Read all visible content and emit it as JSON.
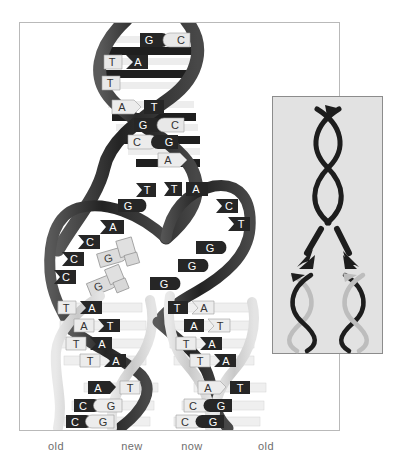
{
  "figure": {
    "background": "#ffffff"
  },
  "colors": {
    "old_strand": "#2b2b2b",
    "old_strand_mid": "#4a4a4a",
    "new_strand": "#d2d2d2",
    "new_strand_edge": "#b0b0b0",
    "base_dark_fill": "#262626",
    "base_light_fill": "#e6e6e6",
    "base_dark_text": "#ffffff",
    "base_light_text": "#3a3a3a",
    "rung_light": "#efefef",
    "rung_dark": "#1f1f1f",
    "frame_border": "#b9b9b9",
    "inset_background": "#e2e2e2",
    "inset_border": "#8c8c8c",
    "label_text": "#6e6e6e",
    "free_nucleotide_fill": "#dcdcdc",
    "free_nucleotide_edge": "#9a9a9a"
  },
  "labels": {
    "old_left": "old",
    "new_left": "new",
    "new_right": "now",
    "old_right": "old"
  },
  "parent_helix": {
    "description": "Unreplicated parent double helix at the top of the figure",
    "base_pairs": [
      {
        "left": "G",
        "right": "C",
        "left_style": "dark",
        "right_style": "light",
        "y": 43
      },
      {
        "left": "T",
        "right": "A",
        "left_style": "light",
        "right_style": "dark",
        "y": 64
      },
      {
        "left": "T",
        "right": "",
        "left_style": "light",
        "right_style": "none",
        "y": 82
      },
      {
        "left": "A",
        "right": "T",
        "left_style": "light",
        "right_style": "dark",
        "y": 107
      },
      {
        "left": "G",
        "right": "C",
        "left_style": "dark",
        "right_style": "light",
        "y": 124
      },
      {
        "left": "C",
        "right": "G",
        "left_style": "light",
        "right_style": "dark",
        "y": 141
      },
      {
        "left": "",
        "right": "A",
        "left_style": "none",
        "right_style": "light",
        "y": 159
      }
    ]
  },
  "replication_fork": {
    "description": "Unwound single strands at the replication fork with unpaired bases",
    "left_template_bases": [
      {
        "base": "T",
        "x": 142,
        "y": 190
      },
      {
        "base": "G",
        "x": 126,
        "y": 205
      },
      {
        "base": "A",
        "x": 112,
        "y": 226
      },
      {
        "base": "C",
        "x": 88,
        "y": 241
      },
      {
        "base": "C",
        "x": 72,
        "y": 258
      },
      {
        "base": "C",
        "x": 64,
        "y": 276
      }
    ],
    "right_template_bases": [
      {
        "base": "T",
        "x": 172,
        "y": 189
      },
      {
        "base": "A",
        "x": 193,
        "y": 189
      },
      {
        "base": "C",
        "x": 226,
        "y": 206
      },
      {
        "base": "T",
        "x": 238,
        "y": 224
      },
      {
        "base": "G",
        "x": 210,
        "y": 247
      },
      {
        "base": "G",
        "x": 192,
        "y": 265
      },
      {
        "base": "G",
        "x": 163,
        "y": 283
      }
    ],
    "free_nucleotides": [
      {
        "base": "G",
        "x": 108,
        "y": 256,
        "rotation": -18
      },
      {
        "base": "G",
        "x": 100,
        "y": 284,
        "rotation": -24
      }
    ]
  },
  "daughter_helix_left": {
    "description": "Newly formed daughter duplex on the left: old dark strand paired with new light strand",
    "base_pairs": [
      {
        "left": "T",
        "right": "A",
        "left_style": "light",
        "right_style": "dark",
        "y": 309
      },
      {
        "left": "A",
        "right": "T",
        "left_style": "light",
        "right_style": "dark",
        "y": 327
      },
      {
        "left": "T",
        "right": "A",
        "left_style": "light",
        "right_style": "dark",
        "y": 345
      },
      {
        "left": "T",
        "right": "A",
        "left_style": "light",
        "right_style": "dark",
        "y": 362
      },
      {
        "left": "A",
        "right": "T",
        "left_style": "dark",
        "right_style": "light",
        "y": 389
      },
      {
        "left": "C",
        "right": "G",
        "left_style": "dark",
        "right_style": "light",
        "y": 407
      },
      {
        "left": "C",
        "right": "G",
        "left_style": "dark",
        "right_style": "light",
        "y": 423
      }
    ]
  },
  "daughter_helix_right": {
    "description": "Newly formed daughter duplex on the right: new light strand paired with old dark strand",
    "base_pairs": [
      {
        "left": "T",
        "right": "A",
        "left_style": "dark",
        "right_style": "light",
        "y": 309
      },
      {
        "left": "A",
        "right": "T",
        "left_style": "dark",
        "right_style": "light",
        "y": 327
      },
      {
        "left": "T",
        "right": "A",
        "left_style": "light",
        "right_style": "dark",
        "y": 345
      },
      {
        "left": "T",
        "right": "A",
        "left_style": "light",
        "right_style": "dark",
        "y": 362
      },
      {
        "left": "A",
        "right": "T",
        "left_style": "light",
        "right_style": "dark",
        "y": 389
      },
      {
        "left": "C",
        "right": "G",
        "left_style": "light",
        "right_style": "dark",
        "y": 407
      },
      {
        "left": "C",
        "right": "G",
        "left_style": "light",
        "right_style": "dark",
        "y": 423
      }
    ]
  },
  "inset": {
    "description": "Schematic summary: one parent helix (two old strands) separates into two daughter helices, each keeping one old strand and gaining one new strand",
    "parent": {
      "strands": [
        "old",
        "old"
      ]
    },
    "arrows": [
      {
        "name": "arrow-left",
        "direction": "down-left"
      },
      {
        "name": "arrow-right",
        "direction": "down-right"
      }
    ],
    "daughters": [
      {
        "name": "daughter-left",
        "strands": [
          "old",
          "new"
        ]
      },
      {
        "name": "daughter-right",
        "strands": [
          "new",
          "old"
        ]
      }
    ]
  }
}
